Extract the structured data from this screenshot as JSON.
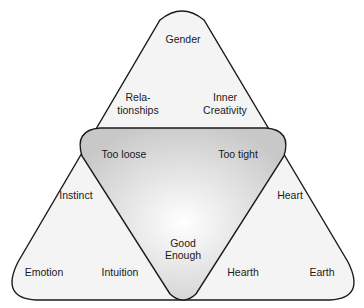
{
  "diagram": {
    "type": "nested-triangles",
    "outer_shape": "rounded-triangle",
    "inner_shape": "inverted-rounded-triangle",
    "colors": {
      "outer_fill": "#f4f4f4",
      "inner_fill_center": "#ffffff",
      "inner_fill_edge": "#c8c8c8",
      "stroke": "#1a1a1a",
      "text": "#1a1a1a"
    },
    "labels": {
      "top_region": {
        "gender": "Gender",
        "relationships": [
          "Rela-",
          "tionships"
        ],
        "inner_creativity": [
          "Inner",
          "Creativity"
        ]
      },
      "center_region": {
        "too_loose": "Too loose",
        "too_tight": "Too tight",
        "good_enough": [
          "Good",
          "Enough"
        ]
      },
      "left_region": {
        "instinct": "Instinct",
        "emotion": "Emotion",
        "intuition": "Intuition"
      },
      "right_region": {
        "heart": "Heart",
        "hearth": "Hearth",
        "earth": "Earth"
      }
    }
  }
}
